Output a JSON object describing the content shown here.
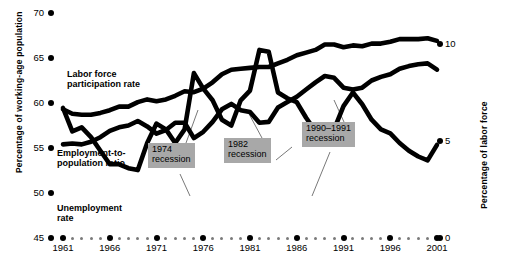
{
  "chart_data": {
    "type": "line",
    "title": "",
    "xlabel": "",
    "ylabel": "Percentage of working-age population",
    "ylabel_right": "Percentage of labor force",
    "xlim": [
      1961,
      2001
    ],
    "ylim": [
      45,
      70
    ],
    "ylim_right": [
      0,
      11.6
    ],
    "yticks": [
      45,
      50,
      55,
      60,
      65,
      70
    ],
    "yticks_right": [
      0,
      5,
      10
    ],
    "xticks": [
      1961,
      1966,
      1971,
      1976,
      1981,
      1986,
      1991,
      1996,
      2001
    ],
    "grid": false,
    "legend": "inline-labels",
    "x": [
      1961,
      1962,
      1963,
      1964,
      1965,
      1966,
      1967,
      1968,
      1969,
      1970,
      1971,
      1972,
      1973,
      1974,
      1975,
      1976,
      1977,
      1978,
      1979,
      1980,
      1981,
      1982,
      1983,
      1984,
      1985,
      1986,
      1987,
      1988,
      1989,
      1990,
      1991,
      1992,
      1993,
      1994,
      1995,
      1996,
      1997,
      1998,
      1999,
      2000,
      2001
    ],
    "series": [
      {
        "name": "Labor force participation rate",
        "axis": "left",
        "values": [
          59.3,
          58.8,
          58.7,
          58.7,
          58.9,
          59.2,
          59.6,
          59.6,
          60.1,
          60.4,
          60.2,
          60.4,
          60.8,
          61.3,
          61.2,
          61.6,
          62.3,
          63.2,
          63.7,
          63.8,
          63.9,
          64.0,
          64.0,
          64.4,
          64.8,
          65.3,
          65.6,
          65.9,
          66.5,
          66.5,
          66.2,
          66.4,
          66.3,
          66.6,
          66.6,
          66.8,
          67.1,
          67.1,
          67.1,
          67.2,
          66.9
        ]
      },
      {
        "name": "Employment-to-population ratio",
        "axis": "left",
        "values": [
          55.4,
          55.5,
          55.4,
          55.7,
          56.2,
          56.9,
          57.3,
          57.5,
          58.0,
          57.4,
          56.6,
          57.0,
          57.8,
          57.8,
          56.1,
          56.8,
          57.9,
          59.3,
          59.9,
          59.2,
          59.0,
          57.8,
          57.9,
          59.5,
          60.1,
          60.7,
          61.5,
          62.3,
          63.0,
          62.8,
          61.7,
          61.5,
          61.7,
          62.5,
          62.9,
          63.2,
          63.8,
          64.1,
          64.3,
          64.4,
          63.7
        ]
      },
      {
        "name": "Unemployment rate",
        "axis": "right",
        "values": [
          6.7,
          5.5,
          5.7,
          5.2,
          4.5,
          3.8,
          3.8,
          3.6,
          3.5,
          4.9,
          5.9,
          5.6,
          4.9,
          5.6,
          8.5,
          7.7,
          7.1,
          6.1,
          5.8,
          7.1,
          7.6,
          9.7,
          9.6,
          7.5,
          7.2,
          7.0,
          6.2,
          5.5,
          5.3,
          5.6,
          6.8,
          7.5,
          6.9,
          6.1,
          5.6,
          5.4,
          4.9,
          4.5,
          4.2,
          4.0,
          4.8
        ]
      }
    ],
    "annotations": [
      {
        "name": "1974 recession",
        "text": "1974\nrecession",
        "year": 1974
      },
      {
        "name": "1982 recession",
        "text": "1982\nrecession",
        "year": 1982
      },
      {
        "name": "1990-1991 recession",
        "text": "1990–1991\nrecession",
        "year": 1990
      }
    ],
    "colors": {
      "line": "#000000",
      "callout_bg": "#a8a8a8",
      "background": "#ffffff"
    }
  },
  "axes": {
    "left": {
      "title": "Percentage of working-age population",
      "ticks": [
        "70",
        "65",
        "60",
        "55",
        "50",
        "45"
      ]
    },
    "right": {
      "title": "Percentage of labor force",
      "ticks": [
        "10",
        "5",
        "0"
      ]
    },
    "x": {
      "ticks": [
        "1961",
        "1966",
        "1971",
        "1976",
        "1981",
        "1986",
        "1991",
        "1996",
        "2001"
      ]
    }
  },
  "series_labels": {
    "lfp": "Labor force\nparticipation rate",
    "epop": "Employment-to-\npopulation ratio",
    "unemp": "Unemployment\nrate"
  },
  "callouts": {
    "r1974": "1974\nrecession",
    "r1982": "1982\nrecession",
    "r1990": "1990–1991\nrecession"
  }
}
